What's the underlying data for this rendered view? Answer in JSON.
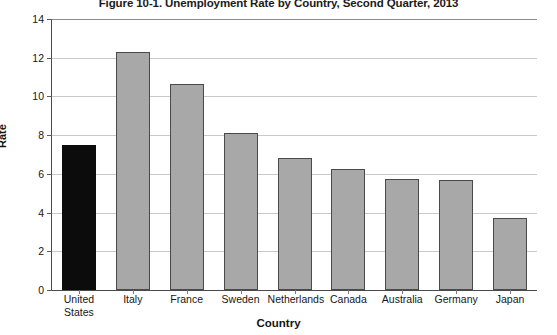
{
  "chart_data": {
    "type": "bar",
    "title": "Figure 10-1. Unemployment Rate by Country, Second Quarter, 2013",
    "xlabel": "Country",
    "ylabel": "Rate",
    "categories": [
      "United States",
      "Italy",
      "France",
      "Sweden",
      "Netherlands",
      "Canada",
      "Australia",
      "Germany",
      "Japan"
    ],
    "values": [
      7.5,
      12.3,
      10.65,
      8.1,
      6.8,
      6.25,
      5.75,
      5.7,
      3.7
    ],
    "ylim": [
      0,
      14
    ],
    "yticks": [
      0,
      2,
      4,
      6,
      8,
      10,
      12,
      14
    ],
    "ytick_labels": [
      "0",
      "2",
      "4",
      "6",
      "8",
      "10",
      "12",
      "14"
    ],
    "grid": true,
    "legend": "none",
    "highlight_index": 0,
    "colors": {
      "bar": "#a8a8a8",
      "bar_highlight": "#0c0c0c",
      "bar_edge": "#4a4a4a",
      "gridline": "#c9c9c9",
      "axis": "#4a4a4a",
      "text": "#161616"
    }
  }
}
